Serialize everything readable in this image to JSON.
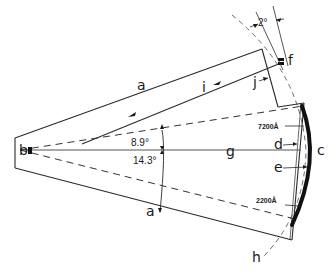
{
  "diagram": {
    "type": "spectrograph optical layout (schematic)",
    "labels": {
      "a_top": "a",
      "a_bottom": "a",
      "b": "b",
      "c": "c",
      "d": "d",
      "e": "e",
      "f": "f",
      "g": "g",
      "h": "h",
      "i": "i",
      "j": "j"
    },
    "angles": {
      "upper": "8.9°",
      "lower": "14.3°",
      "tilt": "2°"
    },
    "wavelengths": {
      "upper": "7200Å",
      "lower": "2200Å"
    },
    "colors": {
      "ink": "#1a1a1a",
      "background": "#ffffff"
    }
  }
}
